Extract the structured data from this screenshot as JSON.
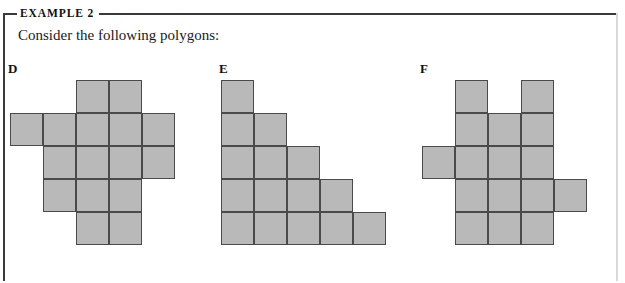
{
  "example": {
    "label": "EXAMPLE 2",
    "intro": "Consider the following polygons:"
  },
  "style": {
    "cell_fill": "#b9b9b9",
    "cell_stroke": "#4a4a4a",
    "frame_stroke": "#3a3a3a",
    "cell_size_px": 33
  },
  "figures": [
    {
      "id": "d",
      "label": "D",
      "rows": 5,
      "cols": 5,
      "cell_count": 16,
      "grid": [
        [
          0,
          0,
          1,
          1,
          0
        ],
        [
          1,
          1,
          1,
          1,
          1
        ],
        [
          0,
          1,
          1,
          1,
          1
        ],
        [
          0,
          1,
          1,
          1,
          0
        ],
        [
          0,
          0,
          1,
          1,
          0
        ]
      ]
    },
    {
      "id": "e",
      "label": "E",
      "rows": 5,
      "cols": 5,
      "cell_count": 15,
      "grid": [
        [
          1,
          0,
          0,
          0,
          0
        ],
        [
          1,
          1,
          0,
          0,
          0
        ],
        [
          1,
          1,
          1,
          0,
          0
        ],
        [
          1,
          1,
          1,
          1,
          0
        ],
        [
          1,
          1,
          1,
          1,
          1
        ]
      ]
    },
    {
      "id": "f",
      "label": "F",
      "rows": 5,
      "cols": 5,
      "cell_count": 16,
      "grid": [
        [
          0,
          1,
          0,
          1,
          0
        ],
        [
          0,
          1,
          1,
          1,
          0
        ],
        [
          1,
          1,
          1,
          1,
          0
        ],
        [
          0,
          1,
          1,
          1,
          1
        ],
        [
          0,
          1,
          1,
          1,
          0
        ]
      ]
    }
  ]
}
